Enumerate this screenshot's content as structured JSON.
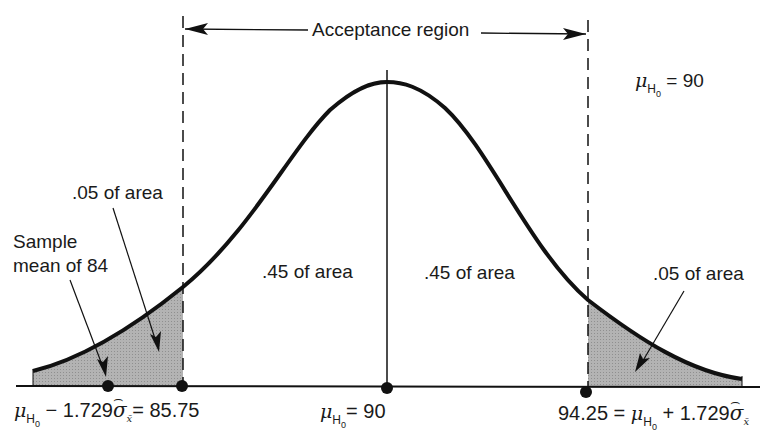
{
  "diagram": {
    "acceptance_region_label": "Acceptance region",
    "mean_annotation": {
      "symbol": "μ",
      "subscript": "H",
      "subsubscript": "0",
      "value": "= 90"
    },
    "left_tail_area_label": ".05 of area",
    "right_tail_area_label": ".05 of area",
    "left_center_area_label": ".45 of area",
    "right_center_area_label": ".45 of area",
    "sample_mean_label_line1": "Sample",
    "sample_mean_label_line2": "mean of 84",
    "axis_labels": {
      "left": {
        "mu": "μ",
        "sub": "H",
        "subsub": "0",
        "expr": " − 1.729",
        "sigma": "σ",
        "sigma_sub": "x̄",
        "result": "= 85.75"
      },
      "center": {
        "mu": "μ",
        "sub": "H",
        "subsub": "0",
        "result": "= 90"
      },
      "right": {
        "prefix": "94.25 = ",
        "mu": "μ",
        "sub": "H",
        "subsub": "0",
        "expr": " + 1.729",
        "sigma": "σ",
        "sigma_sub": "x̄"
      }
    },
    "points": [
      {
        "name": "sample-mean",
        "value": 84
      },
      {
        "name": "lower-limit",
        "value": 85.75
      },
      {
        "name": "hypothesized-mean",
        "value": 90
      },
      {
        "name": "upper-limit",
        "value": 94.25
      }
    ],
    "colors": {
      "ink": "#111111",
      "shade": "#a9a9a9",
      "background": "#ffffff"
    }
  }
}
